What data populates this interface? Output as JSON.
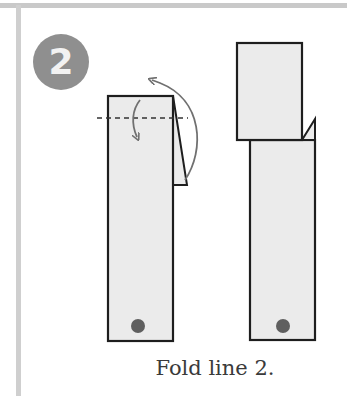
{
  "step": {
    "number": "2",
    "badge_color": "#8f8f8f"
  },
  "diagram": {
    "paper_fill": "#ebebeb",
    "outline_color": "#1e1e1e",
    "arrow_color": "#707070",
    "dot_color": "#5f5f5f",
    "panels": [
      {
        "name": "before-fold",
        "elements": [
          "strip",
          "dashed-fold-line",
          "fold-down-arrow",
          "fold-over-arrow",
          "side-flap",
          "dot"
        ]
      },
      {
        "name": "after-fold",
        "elements": [
          "folded-top-flap",
          "lower-strip",
          "side-flap",
          "dot"
        ]
      }
    ]
  },
  "caption": "Fold line 2."
}
